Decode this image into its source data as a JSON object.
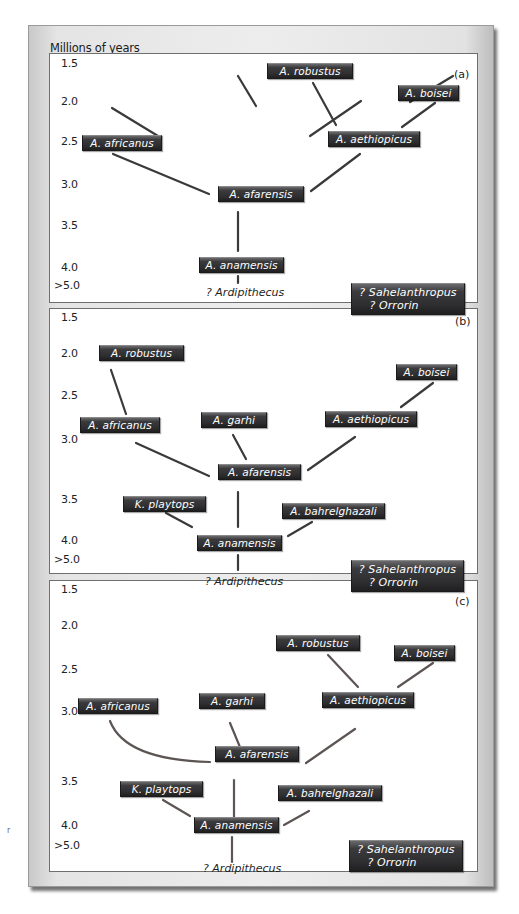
{
  "figure": {
    "axis_title": "Millions of years",
    "ticks": [
      "1.5",
      "2.0",
      "2.5",
      "3.0",
      "3.5",
      "4.0",
      ">5.0"
    ],
    "line_color": "#3a3a3a",
    "line_color_c": "#5c5554",
    "node_color": "#2f2f31",
    "side_mark": "r"
  },
  "panels": [
    {
      "tag": "(a)",
      "nodes": {
        "robustus": "A. robustus",
        "boisei": "A. boisei",
        "africanus": "A. africanus",
        "aethiopicus": "A. aethiopicus",
        "afarensis": "A. afarensis",
        "anamensis": "A. anamensis",
        "ardipithecus": "? Ardipithecus",
        "sahelanthropus": "? Sahelanthropus",
        "orrorin": "? Orrorin"
      }
    },
    {
      "tag": "(b)",
      "nodes": {
        "robustus": "A. robustus",
        "boisei": "A. boisei",
        "africanus": "A. africanus",
        "garhi": "A. garhi",
        "aethiopicus": "A. aethiopicus",
        "afarensis": "A. afarensis",
        "playtops": "K. playtops",
        "bahrelghazali": "A. bahrelghazali",
        "anamensis": "A. anamensis",
        "ardipithecus": "? Ardipithecus",
        "sahelanthropus": "? Sahelanthropus",
        "orrorin": "? Orrorin"
      }
    },
    {
      "tag": "(c)",
      "nodes": {
        "robustus": "A. robustus",
        "boisei": "A. boisei",
        "africanus": "A. africanus",
        "garhi": "A. garhi",
        "aethiopicus": "A. aethiopicus",
        "afarensis": "A. afarensis",
        "playtops": "K. playtops",
        "bahrelghazali": "A. bahrelghazali",
        "anamensis": "A. anamensis",
        "ardipithecus": "? Ardipithecus",
        "sahelanthropus": "? Sahelanthropus",
        "orrorin": "? Orrorin"
      }
    }
  ]
}
